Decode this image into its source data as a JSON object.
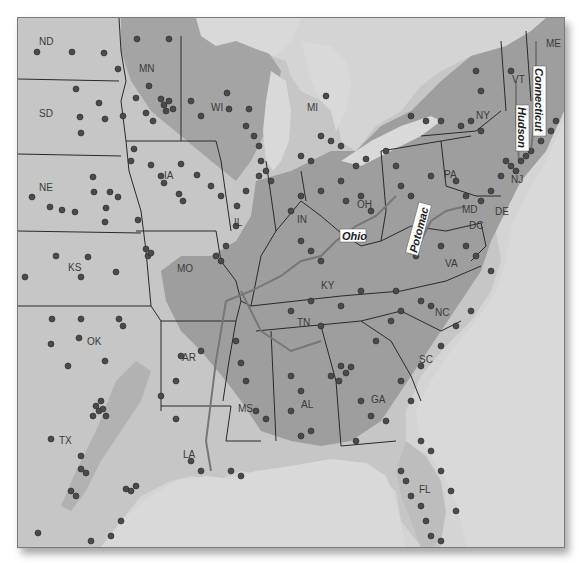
{
  "map": {
    "title": "Eastern United States station map",
    "colors": {
      "water": "#d9d9d9",
      "land_light": "#c8c8c8",
      "land_mid": "#a9a9a9",
      "land_dark": "#8f8f8f",
      "dot": "#4a4a4a",
      "border": "#2a2a2a",
      "river": "#777777"
    },
    "state_labels": [
      {
        "id": "ND",
        "text": "ND",
        "x": 21,
        "y": 27
      },
      {
        "id": "MN",
        "text": "MN",
        "x": 121,
        "y": 52
      },
      {
        "id": "SD",
        "text": "SD",
        "x": 21,
        "y": 88
      },
      {
        "id": "WI",
        "text": "WI",
        "x": 210,
        "y": 88
      },
      {
        "id": "MI",
        "text": "MI",
        "x": 305,
        "y": 92
      },
      {
        "id": "NE",
        "text": "NE",
        "x": 21,
        "y": 170
      },
      {
        "id": "IA",
        "text": "IA",
        "x": 148,
        "y": 158
      },
      {
        "id": "IL",
        "text": "IL",
        "x": 218,
        "y": 205
      },
      {
        "id": "KS",
        "text": "KS",
        "x": 52,
        "y": 250
      },
      {
        "id": "MO",
        "text": "MO",
        "x": 160,
        "y": 251
      },
      {
        "id": "OK",
        "text": "OK",
        "x": 70,
        "y": 324
      },
      {
        "id": "AR",
        "text": "AR",
        "x": 165,
        "y": 350
      },
      {
        "id": "TX",
        "text": "TX",
        "x": 40,
        "y": 440
      },
      {
        "id": "LA",
        "text": "LA",
        "x": 165,
        "y": 453
      },
      {
        "id": "MS",
        "text": "MS",
        "x": 220,
        "y": 410
      },
      {
        "id": "AL",
        "text": "AL",
        "x": 295,
        "y": 405
      },
      {
        "id": "GA",
        "text": "GA",
        "x": 370,
        "y": 400
      },
      {
        "id": "TN",
        "text": "TN",
        "x": 295,
        "y": 323
      },
      {
        "id": "NC",
        "text": "NC",
        "x": 430,
        "y": 313
      },
      {
        "id": "SC",
        "text": "SC",
        "x": 410,
        "y": 360
      },
      {
        "id": "FL",
        "text": "FL",
        "x": 420,
        "y": 490
      },
      {
        "id": "KY",
        "text": "KY",
        "x": 320,
        "y": 265
      },
      {
        "id": "IN",
        "text": "IN",
        "x": 285,
        "y": 220
      },
      {
        "id": "OH",
        "text": "OH",
        "x": 355,
        "y": 205
      },
      {
        "id": "VA",
        "text": "VA",
        "x": 445,
        "y": 265
      },
      {
        "id": "PA",
        "text": "PA",
        "x": 445,
        "y": 175
      },
      {
        "id": "NY",
        "text": "NY",
        "x": 475,
        "y": 116
      },
      {
        "id": "VT",
        "text": "VT",
        "x": 513,
        "y": 80
      },
      {
        "id": "ME",
        "text": "ME",
        "x": 545,
        "y": 45
      },
      {
        "id": "MD",
        "text": "MD",
        "x": 465,
        "y": 210
      },
      {
        "id": "DE",
        "text": "DE",
        "x": 495,
        "y": 212
      },
      {
        "id": "DC",
        "text": "DC",
        "x": 470,
        "y": 225
      },
      {
        "id": "NJ",
        "text": "NJ",
        "x": 515,
        "y": 180
      }
    ],
    "river_labels": [
      {
        "id": "ohio",
        "text": "Ohio",
        "x": 340,
        "y": 232,
        "rotate": 0
      },
      {
        "id": "potomac",
        "text": "Potomac",
        "x": 420,
        "y": 220,
        "rotate": -75
      },
      {
        "id": "hudson",
        "text": "Hudson",
        "x": 521,
        "y": 130,
        "rotate": 90
      },
      {
        "id": "connecticut",
        "text": "Connecticut",
        "x": 540,
        "y": 105,
        "rotate": 90
      }
    ]
  }
}
